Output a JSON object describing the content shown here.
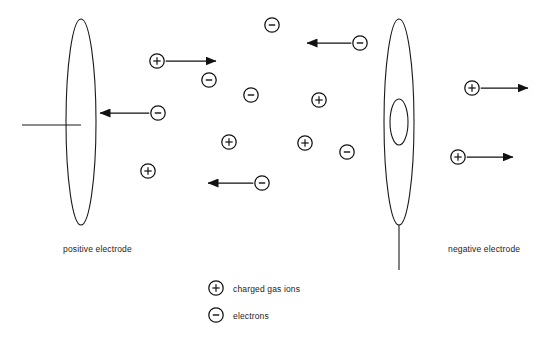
{
  "diagram": {
    "stroke_color": "#1a1a1a",
    "background": "#ffffff",
    "labels": {
      "positive_electrode": "positive electrode",
      "negative_electrode": "negative electrode"
    },
    "electrodes": [
      {
        "name": "positive-electrode",
        "polarity": "positive",
        "cx": 81,
        "cy": 122,
        "rx": 15,
        "ry": 103,
        "lead": {
          "orientation": "horizontal",
          "x1": 22,
          "y1": 125,
          "x2": 81,
          "y2": 125
        },
        "aperture": null
      },
      {
        "name": "negative-electrode",
        "polarity": "negative",
        "cx": 399,
        "cy": 122,
        "rx": 15,
        "ry": 103,
        "lead": {
          "orientation": "vertical",
          "x1": 399,
          "y1": 225,
          "x2": 399,
          "y2": 270
        },
        "aperture": {
          "cx": 399,
          "cy": 122,
          "rx": 9,
          "ry": 23
        }
      }
    ],
    "particles": [
      {
        "kind": "ion",
        "symbol": "+",
        "x": 157,
        "y": 61,
        "arrow": {
          "direction": "right",
          "to_x": 216
        }
      },
      {
        "kind": "electron",
        "symbol": "−",
        "x": 158,
        "y": 113,
        "arrow": {
          "direction": "left",
          "to_x": 100
        }
      },
      {
        "kind": "electron",
        "symbol": "−",
        "x": 360,
        "y": 43,
        "arrow": {
          "direction": "left",
          "to_x": 307
        }
      },
      {
        "kind": "electron",
        "symbol": "−",
        "x": 262,
        "y": 183,
        "arrow": {
          "direction": "left",
          "to_x": 208
        }
      },
      {
        "kind": "ion",
        "symbol": "+",
        "x": 472,
        "y": 88,
        "arrow": {
          "direction": "right",
          "to_x": 528
        }
      },
      {
        "kind": "ion",
        "symbol": "+",
        "x": 458,
        "y": 157,
        "arrow": {
          "direction": "right",
          "to_x": 513
        }
      },
      {
        "kind": "electron",
        "symbol": "−",
        "x": 272,
        "y": 25,
        "arrow": null
      },
      {
        "kind": "electron",
        "symbol": "−",
        "x": 209,
        "y": 80,
        "arrow": null
      },
      {
        "kind": "electron",
        "symbol": "−",
        "x": 251,
        "y": 95,
        "arrow": null
      },
      {
        "kind": "ion",
        "symbol": "+",
        "x": 319,
        "y": 100,
        "arrow": null
      },
      {
        "kind": "ion",
        "symbol": "+",
        "x": 229,
        "y": 142,
        "arrow": null
      },
      {
        "kind": "ion",
        "symbol": "+",
        "x": 305,
        "y": 143,
        "arrow": null
      },
      {
        "kind": "electron",
        "symbol": "−",
        "x": 347,
        "y": 152,
        "arrow": null
      },
      {
        "kind": "ion",
        "symbol": "+",
        "x": 148,
        "y": 171,
        "arrow": null
      }
    ],
    "legend": [
      {
        "symbol": "+",
        "kind": "ion",
        "label": "charged gas ions",
        "x": 216,
        "y": 288
      },
      {
        "symbol": "−",
        "kind": "electron",
        "label": "electrons",
        "x": 216,
        "y": 315
      }
    ]
  }
}
